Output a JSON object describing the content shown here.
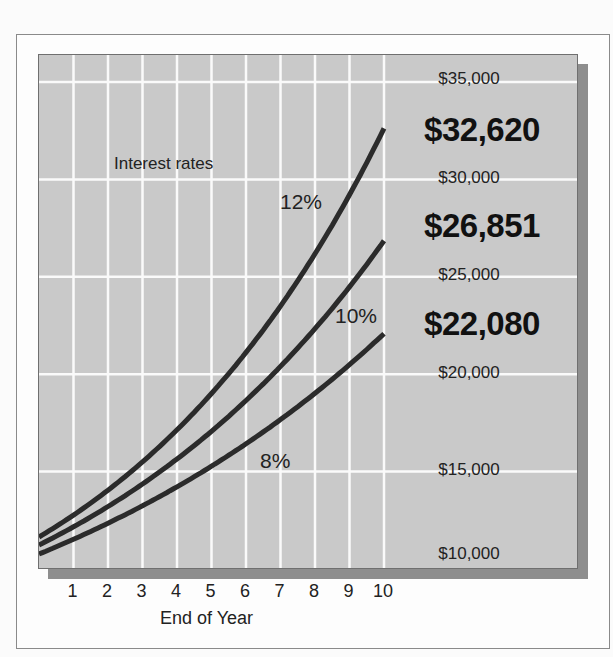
{
  "chart_data": {
    "type": "line",
    "title": "",
    "xlabel": "End of Year",
    "ylabel": "",
    "annotation": "Interest rates",
    "x": [
      0,
      1,
      2,
      3,
      4,
      5,
      6,
      7,
      8,
      9,
      10
    ],
    "x_tick_labels": [
      "1",
      "2",
      "3",
      "4",
      "5",
      "6",
      "7",
      "8",
      "9",
      "10"
    ],
    "y_tick_labels": [
      "$35,000",
      "$30,000",
      "$25,000",
      "$20,000",
      "$15,000",
      "$10,000"
    ],
    "ylim": [
      10000,
      35000
    ],
    "grid": true,
    "series": [
      {
        "name": "12%",
        "rate": 0.12,
        "values": [
          10000,
          11200,
          12544,
          14049,
          15735,
          17623,
          19738,
          22107,
          24760,
          27731,
          31058
        ],
        "end_label": "$32,620"
      },
      {
        "name": "10%",
        "rate": 0.1,
        "values": [
          10000,
          11000,
          12100,
          13310,
          14641,
          16105,
          17716,
          19487,
          21436,
          23579,
          25937
        ],
        "end_label": "$26,851"
      },
      {
        "name": "8%",
        "rate": 0.08,
        "values": [
          10000,
          10800,
          11664,
          12597,
          13605,
          14693,
          15869,
          17138,
          18509,
          19990,
          21589
        ],
        "end_label": "$22,080"
      }
    ],
    "end_values": [
      "$32,620",
      "$26,851",
      "$22,080"
    ]
  },
  "labels": {
    "annotation": "Interest rates",
    "xlabel": "End of Year",
    "y": {
      "y35": "$35,000",
      "y30": "$30,000",
      "y25": "$25,000",
      "y20": "$20,000",
      "y15": "$15,000",
      "y10": "$10,000"
    },
    "big": {
      "r12": "$32,620",
      "r10": "$26,851",
      "r8": "$22,080"
    },
    "curves": {
      "r12": "12%",
      "r10": "10%",
      "r8": "8%"
    },
    "xticks": [
      "1",
      "2",
      "3",
      "4",
      "5",
      "6",
      "7",
      "8",
      "9",
      "10"
    ]
  }
}
